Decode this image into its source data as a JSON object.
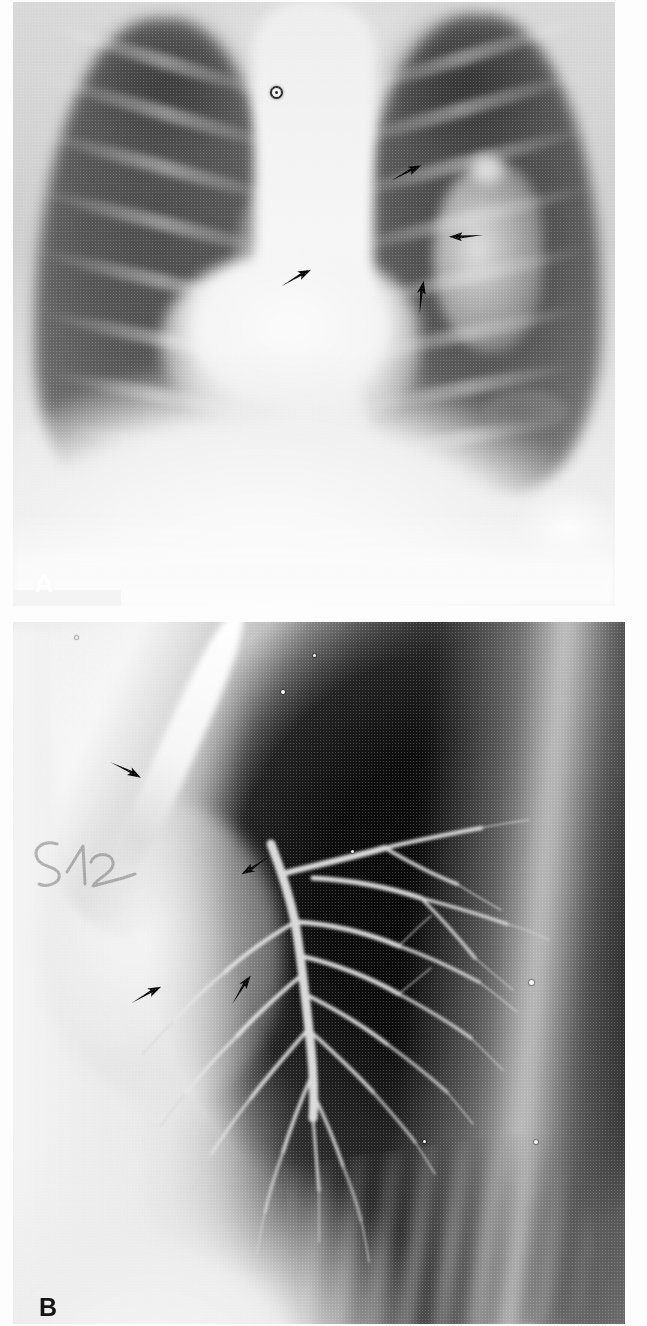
{
  "figure": {
    "type": "medical-radiograph-figure",
    "panel_count": 2,
    "modality": "plain-film radiography",
    "background_color": "#ffffff"
  },
  "panels": [
    {
      "id": "A",
      "label": "A",
      "label_color": "#ffffff",
      "view": "frontal PA chest radiograph",
      "description": "Posteroanterior chest radiograph demonstrating the lungs, mediastinum, cardiac silhouette and both hemidiaphragms. Four black arrows indicate abnormal mediastinal and hilar contours.",
      "annotations": {
        "arrow_count": 4,
        "arrows": [
          {
            "name": "arrow-1",
            "x": 405,
            "y": 175,
            "direction": "up-right",
            "angle_deg": -22,
            "target": "superior left mediastinal border"
          },
          {
            "name": "arrow-2",
            "x": 465,
            "y": 237,
            "direction": "left",
            "angle_deg": 182,
            "target": "left hilar margin"
          },
          {
            "name": "arrow-3",
            "x": 295,
            "y": 280,
            "direction": "up-right",
            "angle_deg": -24,
            "target": "right paratracheal stripe"
          },
          {
            "name": "arrow-4",
            "x": 420,
            "y": 300,
            "direction": "up",
            "angle_deg": -78,
            "target": "left inferior hilar region"
          }
        ],
        "markers": [
          {
            "name": "skin-marker-dot",
            "x": 272,
            "y": 88,
            "appearance": "small circular radiopaque marker"
          }
        ]
      }
    },
    {
      "id": "B",
      "label": "B",
      "label_color": "#141414",
      "view": "lateral bronchogram",
      "description": "Lateral projection bronchogram showing the contrast-filled tracheobronchial tree branching posteriorly and inferiorly. Four black arrows indicate the abnormal region.",
      "annotations": {
        "arrow_count": 4,
        "arrows": [
          {
            "name": "arrow-1",
            "x": 125,
            "y": 775,
            "direction": "down-right",
            "angle_deg": 32,
            "target": "contrast-filled trachea"
          },
          {
            "name": "arrow-2",
            "x": 255,
            "y": 870,
            "direction": "down-left",
            "angle_deg": 152,
            "target": "proximal bronchus origin"
          },
          {
            "name": "arrow-3",
            "x": 145,
            "y": 1000,
            "direction": "up-right",
            "angle_deg": -24,
            "target": "anterior lesion margin"
          },
          {
            "name": "arrow-4",
            "x": 240,
            "y": 995,
            "direction": "up-right",
            "angle_deg": -52,
            "target": "posterior lesion margin"
          }
        ],
        "handwritten_note": {
          "name": "handwritten-film-number",
          "text": "512",
          "x": 14,
          "y": 828,
          "appearance": "faint grease-pencil handwriting on the film"
        }
      }
    }
  ],
  "colors": {
    "film_dark": "#0d0d0d",
    "film_mid": "#6a6a6a",
    "film_light": "#f4f4f4",
    "arrow": "#0a0a0a",
    "page_background": "#ffffff"
  }
}
